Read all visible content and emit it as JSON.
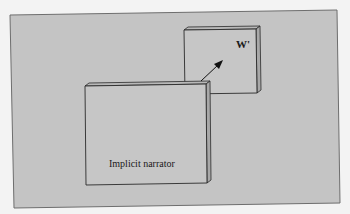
{
  "diagram": {
    "type": "box-arrow diagram",
    "frame": {
      "fill": "#c4c4c4",
      "border": "#6e6e6e",
      "outside": "#f3f3f3"
    },
    "nodes": [
      {
        "id": "implicit-narrator",
        "label": "Implicit narrator",
        "position": "front-left, larger box"
      },
      {
        "id": "w-prime",
        "label": "W'",
        "position": "back-right, smaller box"
      }
    ],
    "edges": [
      {
        "from": "implicit-narrator",
        "to": "w-prime",
        "style": "arrow"
      }
    ],
    "colors": {
      "box_face": "#c6c6c6",
      "box_edge": "#2a2a2a",
      "box_side": "#a8a8a8",
      "arrow": "#111111"
    }
  }
}
